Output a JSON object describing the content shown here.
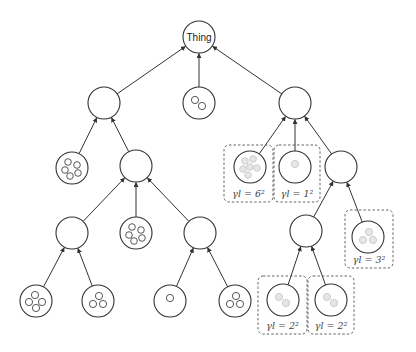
{
  "diagram": {
    "root_label": "Thing",
    "colors": {
      "stroke": "#333333",
      "faded_instance_fill": "#e6e6e6",
      "faded_instance_stroke": "#c8c8c8",
      "dashed_box": "#555555"
    },
    "nodes": [
      {
        "id": "root",
        "cx": 199,
        "cy": 37,
        "label": "Thing",
        "instances": 0
      },
      {
        "id": "L1a",
        "cx": 104,
        "cy": 103,
        "instances": 0
      },
      {
        "id": "L1b",
        "cx": 199,
        "cy": 103,
        "instances": 2
      },
      {
        "id": "L1c",
        "cx": 295,
        "cy": 103,
        "instances": 0
      },
      {
        "id": "L2a",
        "cx": 72,
        "cy": 168,
        "instances": 5
      },
      {
        "id": "L2b",
        "cx": 136,
        "cy": 166,
        "instances": 0
      },
      {
        "id": "L2c",
        "cx": 250,
        "cy": 167,
        "instances": 6,
        "faded": true
      },
      {
        "id": "L2d",
        "cx": 295,
        "cy": 167,
        "instances": 1,
        "faded": true
      },
      {
        "id": "L2e",
        "cx": 341,
        "cy": 167,
        "instances": 0
      },
      {
        "id": "L3a",
        "cx": 72,
        "cy": 233,
        "instances": 0
      },
      {
        "id": "L3b",
        "cx": 136,
        "cy": 233,
        "instances": 5
      },
      {
        "id": "L3c",
        "cx": 200,
        "cy": 233,
        "instances": 0
      },
      {
        "id": "L3d",
        "cx": 306,
        "cy": 231,
        "instances": 0
      },
      {
        "id": "L3e",
        "cx": 368,
        "cy": 237,
        "instances": 3,
        "faded": true
      },
      {
        "id": "L4a",
        "cx": 36,
        "cy": 301,
        "instances": 4
      },
      {
        "id": "L4b",
        "cx": 98,
        "cy": 301,
        "instances": 3
      },
      {
        "id": "L4c",
        "cx": 170,
        "cy": 301,
        "instances": 1
      },
      {
        "id": "L4d",
        "cx": 235,
        "cy": 301,
        "instances": 3
      },
      {
        "id": "L4e",
        "cx": 283,
        "cy": 300,
        "instances": 2,
        "faded": true
      },
      {
        "id": "L4f",
        "cx": 331,
        "cy": 300,
        "instances": 2,
        "faded": true
      }
    ],
    "edges": [
      [
        "L1a",
        "root"
      ],
      [
        "L1b",
        "root"
      ],
      [
        "L1c",
        "root"
      ],
      [
        "L2a",
        "L1a"
      ],
      [
        "L2b",
        "L1a"
      ],
      [
        "L2c",
        "L1c"
      ],
      [
        "L2d",
        "L1c"
      ],
      [
        "L2e",
        "L1c"
      ],
      [
        "L3a",
        "L2b"
      ],
      [
        "L3b",
        "L2b"
      ],
      [
        "L3c",
        "L2b"
      ],
      [
        "L3d",
        "L2e"
      ],
      [
        "L3e",
        "L2e"
      ],
      [
        "L4a",
        "L3a"
      ],
      [
        "L4b",
        "L3a"
      ],
      [
        "L4c",
        "L3c"
      ],
      [
        "L4d",
        "L3c"
      ],
      [
        "L4e",
        "L3d"
      ],
      [
        "L4f",
        "L3d"
      ]
    ],
    "dashed_boxes": [
      {
        "node": "L2c",
        "x": 224,
        "y": 145,
        "w": 49,
        "h": 57,
        "label": "γl = 6²"
      },
      {
        "node": "L2d",
        "x": 274,
        "y": 145,
        "w": 46,
        "h": 57,
        "label": "γl = 1²"
      },
      {
        "node": "L3e",
        "x": 345,
        "y": 210,
        "w": 48,
        "h": 58,
        "label": "γl = 3²"
      },
      {
        "node": "L4e",
        "x": 258,
        "y": 276,
        "w": 49,
        "h": 58,
        "label": "γl = 2²"
      },
      {
        "node": "L4f",
        "x": 308,
        "y": 276,
        "w": 46,
        "h": 58,
        "label": "γl = 2²"
      }
    ]
  }
}
